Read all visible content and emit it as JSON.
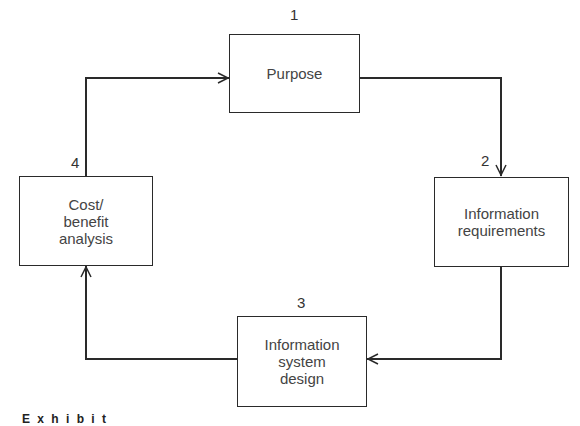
{
  "diagram": {
    "type": "cycle",
    "nodes": [
      {
        "id": 1,
        "number": "1",
        "label": "Purpose"
      },
      {
        "id": 2,
        "number": "2",
        "label": "Information\nrequirements"
      },
      {
        "id": 3,
        "number": "3",
        "label": "Information\nsystem\ndesign"
      },
      {
        "id": 4,
        "number": "4",
        "label": "Cost/\nbenefit\nanalysis"
      }
    ],
    "edges": [
      {
        "from": 1,
        "to": 2
      },
      {
        "from": 2,
        "to": 3
      },
      {
        "from": 3,
        "to": 4
      },
      {
        "from": 4,
        "to": 1
      }
    ],
    "line_color": "#2a2a2a"
  },
  "caption": {
    "text": "E x h i b i t"
  }
}
